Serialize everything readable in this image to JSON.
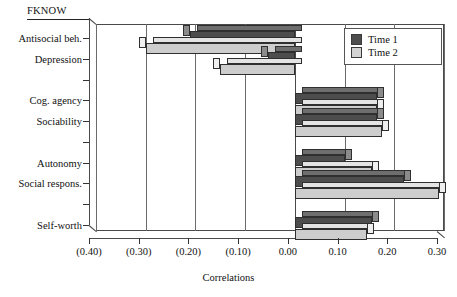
{
  "chart_data": {
    "type": "bar",
    "orientation": "horizontal",
    "title": "FKNOW",
    "xlabel": "Correlations",
    "ylabel": "",
    "xlim": [
      -0.4,
      0.3
    ],
    "xticks": [
      -0.4,
      -0.3,
      -0.2,
      -0.1,
      0.0,
      0.1,
      0.2,
      0.3
    ],
    "xticklabels": [
      "(0.40)",
      "(0.30)",
      "(0.20)",
      "(0.10)",
      "0.00",
      "0.10",
      "0.20",
      "0.30"
    ],
    "grid": true,
    "legend_position": "top-right",
    "categories": [
      "Antisocial beh.",
      "Depression",
      "",
      "Cog. agency",
      "Sociability",
      "",
      "Autonomy",
      "Social respons.",
      "",
      "Self-worth"
    ],
    "series": [
      {
        "name": "Time 1",
        "color": "#4d4d4d",
        "values": [
          -0.21,
          -0.055,
          0,
          0.165,
          0.165,
          0,
          0.1,
          0.22,
          0,
          0.155
        ]
      },
      {
        "name": "Time 2",
        "color": "#d3d3d3",
        "values": [
          -0.3,
          -0.15,
          0,
          0.165,
          0.175,
          0,
          0.155,
          0.29,
          0,
          0.145
        ]
      }
    ]
  },
  "legend": {
    "entries": [
      {
        "label": "Time 1"
      },
      {
        "label": "Time 2"
      }
    ]
  },
  "colors": {
    "series1": "#4d4d4d",
    "series2": "#d3d3d3",
    "axis": "#333333",
    "grid": "#6b6b6b",
    "background": "#ffffff"
  }
}
